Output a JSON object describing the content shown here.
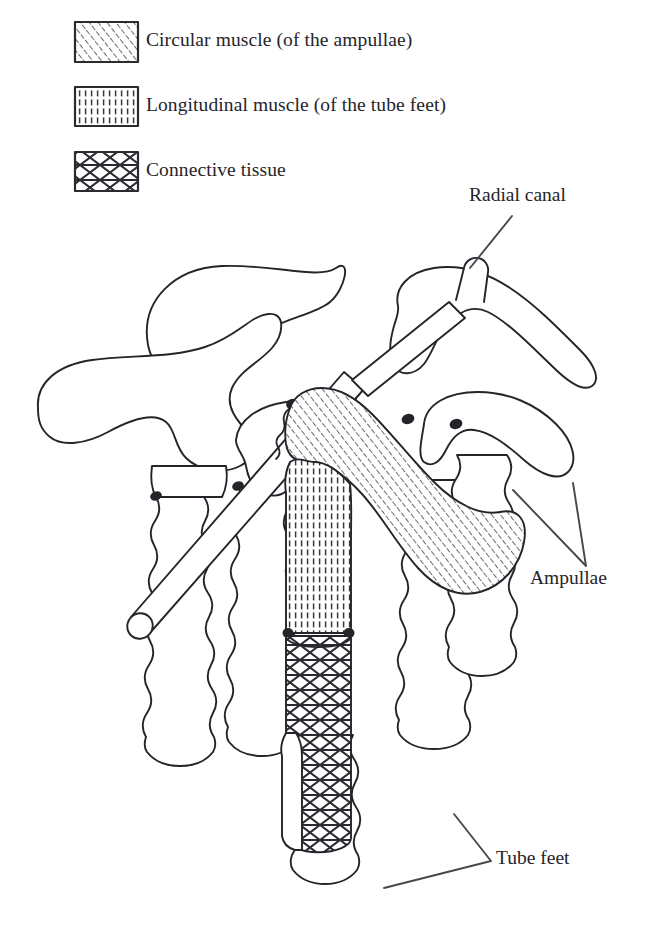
{
  "figure": {
    "background_color": "#ffffff",
    "ink_color": "#26242a",
    "hatch_color": "#3a3740"
  },
  "legend": {
    "items": [
      {
        "id": "circular-muscle",
        "label": "Circular muscle (of the ampullae)",
        "pattern": "diagonal-curved-hatch",
        "swatch": {
          "x": 75,
          "y": 22,
          "w": 63,
          "h": 40
        }
      },
      {
        "id": "longitudinal-muscle",
        "label": "Longitudinal muscle (of the tube feet)",
        "pattern": "vertical-hatch",
        "swatch": {
          "x": 75,
          "y": 87,
          "w": 63,
          "h": 39
        }
      },
      {
        "id": "connective-tissue",
        "label": "Connective tissue",
        "pattern": "cross-hatch-lattice",
        "swatch": {
          "x": 75,
          "y": 152,
          "w": 63,
          "h": 39
        }
      }
    ]
  },
  "callouts": [
    {
      "id": "radial-canal",
      "label": "Radial canal",
      "leader": "line"
    },
    {
      "id": "ampullae",
      "label": "Ampullae",
      "leader": "bracket"
    },
    {
      "id": "tube-feet",
      "label": "Tube feet",
      "leader": "bracket"
    }
  ],
  "structures": {
    "ampullae_count": 4,
    "tube_feet_count": 5,
    "cutaway_ampulla": {
      "tissue": "circular-muscle",
      "description": "Sectioned ampulla showing circular muscle hatching"
    },
    "cutaway_tube_foot": {
      "tissues": [
        "longitudinal-muscle",
        "connective-tissue"
      ],
      "description": "Sectioned tube foot showing longitudinal muscle above a connective tissue band"
    },
    "radial_canal": {
      "description": "Cylindrical canal crossing diagonally from lower left to upper right"
    }
  }
}
